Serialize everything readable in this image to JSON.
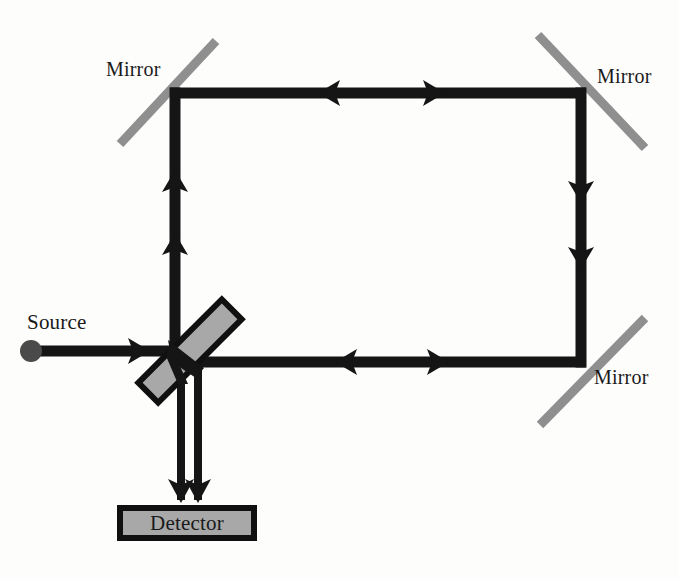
{
  "figure": {
    "canvas": {
      "width": 678,
      "height": 579
    },
    "background_color": "#fdfdfc"
  },
  "colors": {
    "beam": "#151515",
    "mirror": "#8f8f8f",
    "optic_fill": "#a8a8a8",
    "optic_stroke": "#101010",
    "source_dot": "#4a4a4a",
    "text": "#1a1a1a"
  },
  "labels": {
    "mirror_top_left": "Mirror",
    "mirror_top_right": "Mirror",
    "mirror_bottom_right": "Mirror",
    "source": "Source",
    "detector": "Detector"
  },
  "components": {
    "source": {
      "name": "Source",
      "type": "point-source",
      "center": [
        31,
        351
      ],
      "radius": 11,
      "color": "#4a4a4a"
    },
    "beam_splitter": {
      "name": "Beam splitter",
      "type": "beam-splitter",
      "center": [
        190,
        351
      ],
      "length": 118,
      "thickness": 28,
      "angle_deg": -45,
      "fill": "#a8a8a8",
      "stroke": "#101010"
    },
    "mirrors": [
      {
        "name": "Mirror top-left",
        "from": [
          120,
          144
        ],
        "to": [
          216,
          41
        ],
        "thickness": 9,
        "color": "#8f8f8f",
        "orientation": "positive-slope"
      },
      {
        "name": "Mirror top-right",
        "from": [
          538,
          35
        ],
        "to": [
          645,
          148
        ],
        "thickness": 9,
        "color": "#8f8f8f",
        "orientation": "negative-slope"
      },
      {
        "name": "Mirror bottom-right",
        "from": [
          540,
          425
        ],
        "to": [
          645,
          318
        ],
        "thickness": 9,
        "color": "#8f8f8f",
        "orientation": "positive-slope"
      }
    ],
    "detector": {
      "name": "Detector",
      "type": "detector-box",
      "x": 117,
      "y": 505,
      "width": 140,
      "height": 36,
      "fill": "#a8a8a8",
      "stroke": "#101010",
      "stroke_width": 6
    }
  },
  "beams": [
    {
      "name": "source-to-splitter",
      "orientation": "horizontal",
      "from": [
        42,
        351
      ],
      "to": [
        192,
        351
      ],
      "thickness": 11,
      "arrows": [
        {
          "at": [
            140,
            351
          ],
          "direction": "right"
        }
      ]
    },
    {
      "name": "splitter-to-top-left-mirror",
      "orientation": "vertical",
      "from": [
        175,
        355
      ],
      "to": [
        175,
        93
      ],
      "thickness": 11,
      "arrows": [
        {
          "at": [
            175,
            245
          ],
          "direction": "up"
        },
        {
          "at": [
            175,
            182
          ],
          "direction": "up"
        }
      ]
    },
    {
      "name": "top-horizontal-arm",
      "orientation": "horizontal",
      "from": [
        170,
        93
      ],
      "to": [
        586,
        93
      ],
      "thickness": 11,
      "arrows": [
        {
          "at": [
            330,
            93
          ],
          "direction": "left"
        },
        {
          "at": [
            433,
            93
          ],
          "direction": "right"
        }
      ]
    },
    {
      "name": "right-vertical-arm",
      "orientation": "vertical",
      "from": [
        581,
        88
      ],
      "to": [
        581,
        367
      ],
      "thickness": 11,
      "arrows": [
        {
          "at": [
            581,
            190
          ],
          "direction": "down"
        },
        {
          "at": [
            581,
            256
          ],
          "direction": "down"
        }
      ]
    },
    {
      "name": "bottom-horizontal-arm",
      "orientation": "horizontal",
      "from": [
        586,
        362
      ],
      "to": [
        193,
        362
      ],
      "thickness": 11,
      "arrows": [
        {
          "at": [
            437,
            362
          ],
          "direction": "right"
        },
        {
          "at": [
            347,
            362
          ],
          "direction": "left"
        }
      ]
    },
    {
      "name": "output-beam-left",
      "orientation": "vertical",
      "from": [
        181,
        355
      ],
      "to": [
        181,
        503
      ],
      "thickness": 8,
      "arrows": [
        {
          "at": [
            181,
            495
          ],
          "direction": "down"
        }
      ]
    },
    {
      "name": "output-beam-right",
      "orientation": "vertical",
      "from": [
        198,
        358
      ],
      "to": [
        198,
        503
      ],
      "thickness": 8,
      "arrows": [
        {
          "at": [
            198,
            495
          ],
          "direction": "down"
        }
      ]
    }
  ]
}
